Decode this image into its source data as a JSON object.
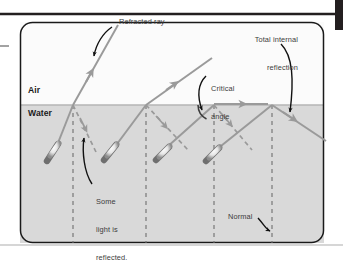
{
  "figure": {
    "type": "physics-optics-diagram",
    "topic": "Refraction, partial reflection and total internal reflection of light at a water-air boundary",
    "background_color": "#ffffff",
    "frame": {
      "border_color": "#1a1a1a",
      "corner_radius_px": 12,
      "top_rule_color": "#231f20",
      "right_bar_color": "#231f20",
      "left_tick_color": "#8c8c8c"
    },
    "media": {
      "air": {
        "label": "Air",
        "fill": "#fbfbfb",
        "top_px": 22,
        "bottom_px": 105
      },
      "water": {
        "label": "Water",
        "fill": "#d9d9d9",
        "top_px": 105,
        "bottom_px": 243
      },
      "interface_y_px": 105,
      "interface_color": "#b4b4b4"
    },
    "ray_color": "#9a9a9a",
    "arrow_color": "#9a9a9a",
    "normal_color": "#6e6e6e",
    "annotation_color": "#3b3b3b",
    "leader_color": "#111111"
  },
  "labels": {
    "air": "Air",
    "water": "Water",
    "refracted_ray": "Refracted ray",
    "total_internal_reflection_line1": "Total internal",
    "total_internal_reflection_line2": "reflection",
    "critical_angle_line1": "Critical",
    "critical_angle_line2": "angle",
    "some_light_line1": "Some",
    "some_light_line2": "light is",
    "some_light_line3": "reflected.",
    "normal": "Normal"
  },
  "normals": {
    "description": "Dashed vertical normal lines drawn at each point where a ray meets the water-air boundary",
    "x_positions_px": [
      73,
      146,
      214,
      272
    ],
    "top_px": 105,
    "bottom_px": 243,
    "dash_pattern": "4,4"
  },
  "ray_groups": [
    {
      "id": "group-1",
      "name": "small-angle-of-incidence",
      "description": "Most light refracts into the air, a small amount reflects back into the water",
      "source_px": [
        52,
        152
      ],
      "hit_point_px": [
        73,
        105
      ],
      "refracted_end_px": [
        118,
        25
      ],
      "reflected_end_px": [
        96,
        152
      ],
      "reflected_style": "dashed"
    },
    {
      "id": "group-2",
      "name": "larger-angle-of-incidence",
      "description": "Refracted ray bends further from the normal; reflected ray grows stronger",
      "source_px": [
        110,
        152
      ],
      "hit_point_px": [
        146,
        105
      ],
      "refracted_end_px": [
        210,
        58
      ],
      "reflected_end_px": [
        186,
        152
      ],
      "reflected_style": "dashed"
    },
    {
      "id": "group-3",
      "name": "critical-angle",
      "description": "Light refracts along the surface at 90 degrees; this incidence is the critical angle",
      "source_px": [
        160,
        152
      ],
      "hit_point_px": [
        214,
        105
      ],
      "refracted_end_px": [
        272,
        105
      ],
      "reflected_end_px": [
        252,
        150
      ],
      "reflected_style": "dashed",
      "arc": {
        "center_px": [
          214,
          105
        ],
        "radius_px": 16
      }
    },
    {
      "id": "group-4",
      "name": "total-internal-reflection",
      "description": "Beyond the critical angle no light escapes; all of it reflects back into the water",
      "source_px": [
        214,
        152
      ],
      "hit_point_px": [
        272,
        105
      ],
      "reflected_end_px": [
        324,
        140
      ],
      "reflected_style": "solid"
    }
  ],
  "annotations": [
    {
      "name": "refracted-ray",
      "text": "Refracted ray",
      "points_to": "refracted ray of group 1"
    },
    {
      "name": "total-internal-reflection",
      "text": "Total internal reflection",
      "points_to": "reflected ray of group 4"
    },
    {
      "name": "critical-angle",
      "text": "Critical angle",
      "points_to": "angle arc at group 3 boundary point"
    },
    {
      "name": "some-light-is-reflected",
      "text": "Some light is reflected.",
      "points_to": "dashed reflected ray of group 1"
    },
    {
      "name": "normal",
      "text": "Normal",
      "points_to": "fourth dashed vertical normal line"
    }
  ]
}
